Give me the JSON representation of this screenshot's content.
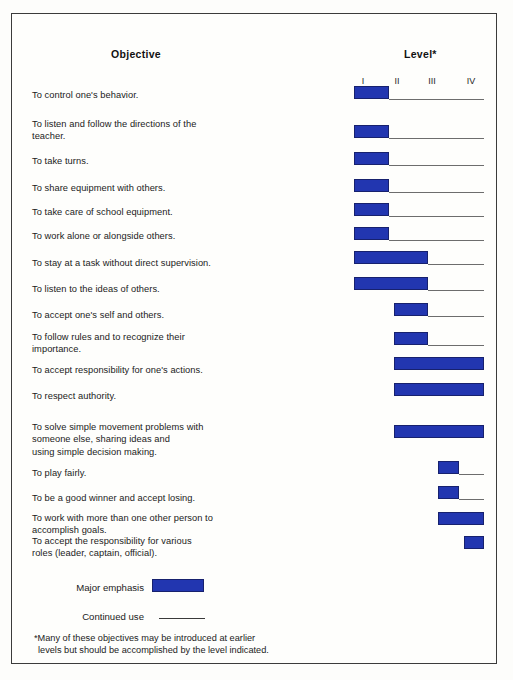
{
  "header": {
    "objective_title": "Objective",
    "level_title": "Level*"
  },
  "legend": {
    "major_emphasis_label": "Major emphasis",
    "continued_use_label": "Continued use",
    "major_emphasis_color": "#2236b0",
    "continued_use_color": "#3a3a3a"
  },
  "footnote": {
    "line1": "*Many of these objectives may be introduced at earlier",
    "line2": "levels but should be accomplished by the level indicated."
  },
  "chart_data": {
    "type": "bar",
    "title": "Objective",
    "xlabel": "Level*",
    "ylabel": "Objective",
    "grid": false,
    "legend_position": "bottom-left",
    "axis_ticks": [
      "I",
      "II",
      "III",
      "IV"
    ],
    "axis_tick_x": [
      362,
      396,
      431,
      470
    ],
    "xlim": [
      1,
      4
    ],
    "note": "Bar = major emphasis span across levels; thin line = continued use",
    "categories": [
      "To control one's behavior.",
      "To listen and follow the directions of the teacher.",
      "To take turns.",
      "To share equipment with others.",
      "To take care of school equipment.",
      "To work alone or alongside others.",
      "To stay at a task without direct supervision.",
      "To listen to the ideas of others.",
      "To accept one's self and others.",
      "To follow rules and to recognize their importance.",
      "To accept responsibility for one's actions.",
      "To respect authority.",
      "To solve simple movement problems with someone else, sharing ideas and using simple decision making.",
      "To play fairly.",
      "To be a good winner and accept losing.",
      "To work with more than one other person to accomplish goals.",
      "To accept the responsibility for various roles (leader, captain, official)."
    ],
    "rows": [
      {
        "lines": [
          "To control one's behavior."
        ],
        "text_top": 88,
        "emphasis_start_level": 1,
        "emphasis_end_level": 2,
        "continued_use_to_level": 4,
        "bar_x": 353,
        "bar_w": 35,
        "bar_y": 85,
        "line_x": 388,
        "line_w": 95,
        "line_y": 98
      },
      {
        "lines": [
          "To listen and follow the directions of the",
          "teacher."
        ],
        "text_top": 117,
        "emphasis_start_level": 1,
        "emphasis_end_level": 2,
        "continued_use_to_level": 4,
        "bar_x": 353,
        "bar_w": 35,
        "bar_y": 124,
        "line_x": 388,
        "line_w": 95,
        "line_y": 137
      },
      {
        "lines": [
          "To take turns."
        ],
        "text_top": 154,
        "emphasis_start_level": 1,
        "emphasis_end_level": 2,
        "continued_use_to_level": 4,
        "bar_x": 353,
        "bar_w": 35,
        "bar_y": 151,
        "line_x": 388,
        "line_w": 95,
        "line_y": 164
      },
      {
        "lines": [
          "To share equipment with others."
        ],
        "text_top": 181,
        "emphasis_start_level": 1,
        "emphasis_end_level": 2,
        "continued_use_to_level": 4,
        "bar_x": 353,
        "bar_w": 35,
        "bar_y": 178,
        "line_x": 388,
        "line_w": 95,
        "line_y": 191
      },
      {
        "lines": [
          "To take care of school equipment."
        ],
        "text_top": 205,
        "emphasis_start_level": 1,
        "emphasis_end_level": 2,
        "continued_use_to_level": 4,
        "bar_x": 353,
        "bar_w": 35,
        "bar_y": 202,
        "line_x": 388,
        "line_w": 95,
        "line_y": 215
      },
      {
        "lines": [
          "To work alone or alongside others."
        ],
        "text_top": 229,
        "emphasis_start_level": 1,
        "emphasis_end_level": 2,
        "continued_use_to_level": 4,
        "bar_x": 353,
        "bar_w": 35,
        "bar_y": 226,
        "line_x": 388,
        "line_w": 95,
        "line_y": 239
      },
      {
        "lines": [
          "To stay at a task without direct supervision."
        ],
        "text_top": 256,
        "emphasis_start_level": 1,
        "emphasis_end_level": 3,
        "continued_use_to_level": 4,
        "bar_x": 353,
        "bar_w": 74,
        "bar_y": 250,
        "line_x": 427,
        "line_w": 56,
        "line_y": 263
      },
      {
        "lines": [
          "To listen to the ideas of others."
        ],
        "text_top": 282,
        "emphasis_start_level": 1,
        "emphasis_end_level": 3,
        "continued_use_to_level": 4,
        "bar_x": 353,
        "bar_w": 74,
        "bar_y": 276,
        "line_x": 427,
        "line_w": 56,
        "line_y": 289
      },
      {
        "lines": [
          "To accept one's self and others."
        ],
        "text_top": 308,
        "emphasis_start_level": 2,
        "emphasis_end_level": 3,
        "continued_use_to_level": 4,
        "bar_x": 393,
        "bar_w": 34,
        "bar_y": 302,
        "line_x": 427,
        "line_w": 56,
        "line_y": 315
      },
      {
        "lines": [
          "To follow rules and to recognize their",
          "importance."
        ],
        "text_top": 330,
        "emphasis_start_level": 2,
        "emphasis_end_level": 3,
        "continued_use_to_level": 4,
        "bar_x": 393,
        "bar_w": 34,
        "bar_y": 331,
        "line_x": 427,
        "line_w": 56,
        "line_y": 344
      },
      {
        "lines": [
          "To accept responsibility for one's actions."
        ],
        "text_top": 363,
        "emphasis_start_level": 2,
        "emphasis_end_level": 4,
        "continued_use_to_level": null,
        "bar_x": 393,
        "bar_w": 90,
        "bar_y": 356,
        "line_x": 0,
        "line_w": 0,
        "line_y": 0
      },
      {
        "lines": [
          "To respect authority."
        ],
        "text_top": 389,
        "emphasis_start_level": 2,
        "emphasis_end_level": 4,
        "continued_use_to_level": null,
        "bar_x": 393,
        "bar_w": 90,
        "bar_y": 382,
        "line_x": 0,
        "line_w": 0,
        "line_y": 0
      },
      {
        "lines": [
          "To solve simple movement problems with",
          "someone else, sharing ideas and",
          "using simple decision making."
        ],
        "text_top": 420,
        "emphasis_start_level": 2,
        "emphasis_end_level": 4,
        "continued_use_to_level": null,
        "bar_x": 393,
        "bar_w": 90,
        "bar_y": 424,
        "line_x": 0,
        "line_w": 0,
        "line_y": 0
      },
      {
        "lines": [
          "To play fairly."
        ],
        "text_top": 466,
        "emphasis_start_level": 3,
        "emphasis_end_level": 4,
        "continued_use_to_level": 4,
        "bar_x": 437,
        "bar_w": 21,
        "bar_y": 460,
        "line_x": 458,
        "line_w": 25,
        "line_y": 473
      },
      {
        "lines": [
          "To be a good winner and accept losing."
        ],
        "text_top": 491,
        "emphasis_start_level": 3,
        "emphasis_end_level": 4,
        "continued_use_to_level": 4,
        "bar_x": 437,
        "bar_w": 21,
        "bar_y": 485,
        "line_x": 458,
        "line_w": 25,
        "line_y": 498
      },
      {
        "lines": [
          "To work with more than one other person to",
          "accomplish goals."
        ],
        "text_top": 511,
        "emphasis_start_level": 3,
        "emphasis_end_level": 4,
        "continued_use_to_level": null,
        "bar_x": 437,
        "bar_w": 46,
        "bar_y": 511,
        "line_x": 0,
        "line_w": 0,
        "line_y": 0
      },
      {
        "lines": [
          "To accept the responsibility for various",
          "roles (leader, captain, official)."
        ],
        "text_top": 534,
        "emphasis_start_level": 4,
        "emphasis_end_level": 4,
        "continued_use_to_level": null,
        "bar_x": 463,
        "bar_w": 20,
        "bar_y": 535,
        "line_x": 0,
        "line_w": 0,
        "line_y": 0
      }
    ]
  }
}
